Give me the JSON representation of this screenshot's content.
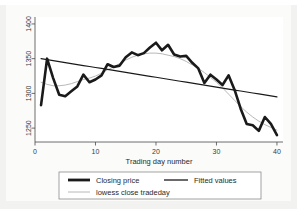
{
  "chart_data": {
    "type": "line",
    "title": "",
    "xlabel": "Trading day number",
    "ylabel": "",
    "xlim": [
      0,
      41
    ],
    "ylim": [
      1230,
      1410
    ],
    "xticks": [
      0,
      10,
      20,
      30,
      40
    ],
    "xtick_labels": [
      "0",
      "10",
      "20",
      "30",
      "40"
    ],
    "yticks": [
      1250,
      1300,
      1350,
      1400
    ],
    "ytick_labels": [
      "1250",
      "1300",
      "1350",
      "1400"
    ],
    "grid": false,
    "legend_position": "below-plot",
    "x": [
      1,
      2,
      3,
      4,
      5,
      6,
      7,
      8,
      9,
      10,
      11,
      12,
      13,
      14,
      15,
      16,
      17,
      18,
      19,
      20,
      21,
      22,
      23,
      24,
      25,
      26,
      27,
      28,
      29,
      30,
      31,
      32,
      33,
      34,
      35,
      36,
      37,
      38,
      39,
      40
    ],
    "series": [
      {
        "name": "Closing price",
        "color": "#1a1a1a",
        "width": 2.6,
        "values": [
          1283,
          1350,
          1322,
          1298,
          1296,
          1303,
          1310,
          1327,
          1316,
          1320,
          1326,
          1342,
          1338,
          1340,
          1352,
          1359,
          1355,
          1358,
          1366,
          1373,
          1362,
          1370,
          1356,
          1353,
          1354,
          1344,
          1336,
          1315,
          1327,
          1320,
          1312,
          1326,
          1305,
          1278,
          1256,
          1254,
          1246,
          1266,
          1256,
          1240
        ]
      },
      {
        "name": "Fitted values",
        "color": "#1a1a1a",
        "width": 1.2,
        "values": [
          1350,
          1348.6,
          1347.2,
          1345.8,
          1344.3,
          1342.9,
          1341.5,
          1340.1,
          1338.7,
          1337.3,
          1335.9,
          1334.5,
          1333.1,
          1331.6,
          1330.2,
          1328.8,
          1327.4,
          1326,
          1324.6,
          1323.2,
          1321.8,
          1320.4,
          1318.9,
          1317.5,
          1316.1,
          1314.7,
          1313.3,
          1311.9,
          1310.5,
          1309.1,
          1307.7,
          1306.2,
          1304.8,
          1303.4,
          1302,
          1300.6,
          1299.2,
          1297.8,
          1296.4,
          1295
        ]
      },
      {
        "name": "lowess close tradeday",
        "color": "#b0b0b0",
        "width": 0.9,
        "values": [
          1316,
          1313,
          1311,
          1311,
          1312,
          1314,
          1317,
          1320,
          1322,
          1325,
          1329,
          1334,
          1338,
          1343,
          1348,
          1352,
          1355,
          1357,
          1358,
          1358,
          1357,
          1355,
          1353,
          1350,
          1346,
          1341,
          1336,
          1330,
          1323,
          1316,
          1308,
          1299,
          1290,
          1281,
          1273,
          1266,
          1260,
          1255,
          1251,
          1247
        ]
      }
    ]
  },
  "legend": {
    "items": [
      {
        "label": "Closing price",
        "style": "thick-black"
      },
      {
        "label": "Fitted values",
        "style": "medium-black"
      },
      {
        "label": "lowess close tradeday",
        "style": "thin-gray"
      }
    ]
  },
  "colors": {
    "figure_background": "#f2f2f0",
    "plot_background": "#fbfbfa",
    "axis": "#4a4a4a",
    "primary_line": "#1a1a1a",
    "lowess_line": "#b0b0b0"
  }
}
